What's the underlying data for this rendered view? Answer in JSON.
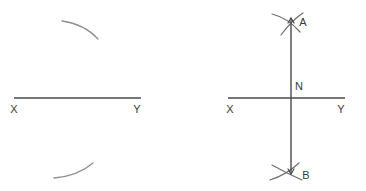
{
  "figure": {
    "title": "Perpendicular bisector construction",
    "background_color": "#ffffff",
    "line_color": "#4a4a4a",
    "arc_color": "#8e8e8e",
    "label_color": "#3a3a3a",
    "panels": [
      {
        "name": "step-1",
        "description": "Segment XY with two construction arcs drawn from endpoints",
        "labels": {
          "x_endpoint": "X",
          "y_endpoint": "Y"
        },
        "segment": {
          "x1": 14,
          "y1": 98,
          "x2": 141,
          "y2": 98
        },
        "arcs": [
          {
            "name": "upper-construction-arc",
            "d": "M 62 21 Q 84 24 98 39"
          },
          {
            "name": "lower-construction-arc",
            "d": "M 54 178 Q 78 176 93 163"
          }
        ]
      },
      {
        "name": "step-2",
        "description": "Completed perpendicular bisector AB through midpoint N of XY",
        "labels": {
          "x_endpoint": "X",
          "y_endpoint": "Y",
          "top_intersection": "A",
          "bottom_intersection": "B",
          "midpoint": "N"
        },
        "segment": {
          "x1": 228,
          "y1": 98,
          "x2": 345,
          "y2": 98
        },
        "perpendicular": {
          "x1": 291,
          "y1": 18,
          "x2": 291,
          "y2": 174
        },
        "arcs": [
          {
            "name": "top-arc-left",
            "d": "M 272 14 Q 288 18 300 32"
          },
          {
            "name": "top-arc-right",
            "d": "M 303 13 Q 292 20 281 35"
          },
          {
            "name": "bottom-arc-left",
            "d": "M 270 180 Q 286 175 299 163"
          },
          {
            "name": "bottom-arc-right",
            "d": "M 272 165 Q 286 173 302 180"
          }
        ]
      }
    ]
  }
}
